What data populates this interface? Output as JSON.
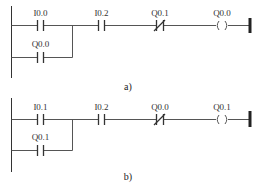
{
  "diagrams": [
    {
      "caption": "a)",
      "main_contact_label": "I0.0",
      "branch_contact_label": "Q0.0",
      "series_contact_label": "I0.2",
      "nc_contact_label": "Q0.1",
      "coil_label": "Q0.0"
    },
    {
      "caption": "b)",
      "main_contact_label": "I0.1",
      "branch_contact_label": "Q0.1",
      "series_contact_label": "I0.2",
      "nc_contact_label": "Q0.0",
      "coil_label": "Q0.1"
    }
  ],
  "colors": {
    "line": "#333333",
    "background": "#ffffff"
  }
}
